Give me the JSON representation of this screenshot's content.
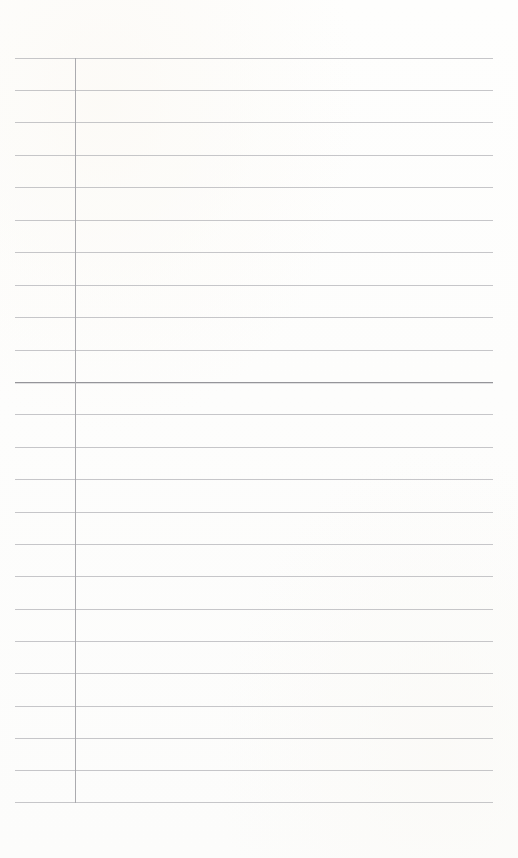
{
  "page": {
    "kind": "lined-notebook-page",
    "width": 518,
    "height": 858,
    "background_color": "#fdfdfc",
    "content_text": "",
    "is_blank": true
  },
  "ruling": {
    "line_color": "#bcbcc0",
    "emphasis_line_color": "#95959a",
    "margin_line_color": "#a6a6ab",
    "line_count": 24,
    "line_spacing_px": 32.3,
    "first_line_y": 58,
    "last_line_y": 802,
    "line_left_x": 15,
    "line_right_x": 493,
    "emphasis_line_index": 10,
    "lines": [
      {
        "y": 58,
        "weight": "normal"
      },
      {
        "y": 90,
        "weight": "normal"
      },
      {
        "y": 122,
        "weight": "normal"
      },
      {
        "y": 155,
        "weight": "normal"
      },
      {
        "y": 187,
        "weight": "normal"
      },
      {
        "y": 220,
        "weight": "normal"
      },
      {
        "y": 252,
        "weight": "normal"
      },
      {
        "y": 285,
        "weight": "normal"
      },
      {
        "y": 317,
        "weight": "normal"
      },
      {
        "y": 350,
        "weight": "normal"
      },
      {
        "y": 382,
        "weight": "heavy"
      },
      {
        "y": 414,
        "weight": "normal"
      },
      {
        "y": 447,
        "weight": "normal"
      },
      {
        "y": 479,
        "weight": "normal"
      },
      {
        "y": 512,
        "weight": "normal"
      },
      {
        "y": 544,
        "weight": "normal"
      },
      {
        "y": 576,
        "weight": "normal"
      },
      {
        "y": 609,
        "weight": "normal"
      },
      {
        "y": 641,
        "weight": "normal"
      },
      {
        "y": 673,
        "weight": "normal"
      },
      {
        "y": 706,
        "weight": "normal"
      },
      {
        "y": 738,
        "weight": "normal"
      },
      {
        "y": 770,
        "weight": "normal"
      },
      {
        "y": 802,
        "weight": "normal"
      }
    ]
  },
  "margin": {
    "x": 75,
    "top_y": 58,
    "bottom_y": 803
  }
}
